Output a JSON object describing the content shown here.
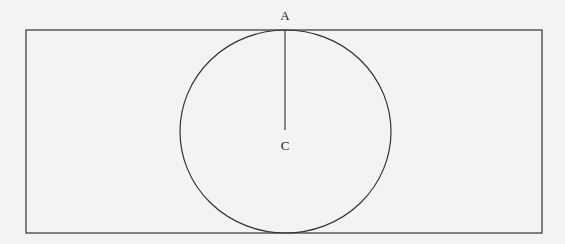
{
  "diagram": {
    "type": "geometry",
    "canvas": {
      "width": 565,
      "height": 244,
      "background": "#f3f3f3"
    },
    "stroke_color": "#333333",
    "line_color": "#555555",
    "rectangle": {
      "x": 26,
      "y": 30,
      "width": 516,
      "height": 203
    },
    "circle": {
      "cx": 285.5,
      "cy": 131.5,
      "rx": 105.5,
      "ry": 101.5
    },
    "segment": {
      "from": "A",
      "to": "C",
      "x1": 285,
      "y1": 30,
      "x2": 285,
      "y2": 130
    },
    "points": [
      {
        "label": "A",
        "x": 285,
        "y": 20
      },
      {
        "label": "C",
        "x": 285,
        "y": 150
      }
    ]
  }
}
